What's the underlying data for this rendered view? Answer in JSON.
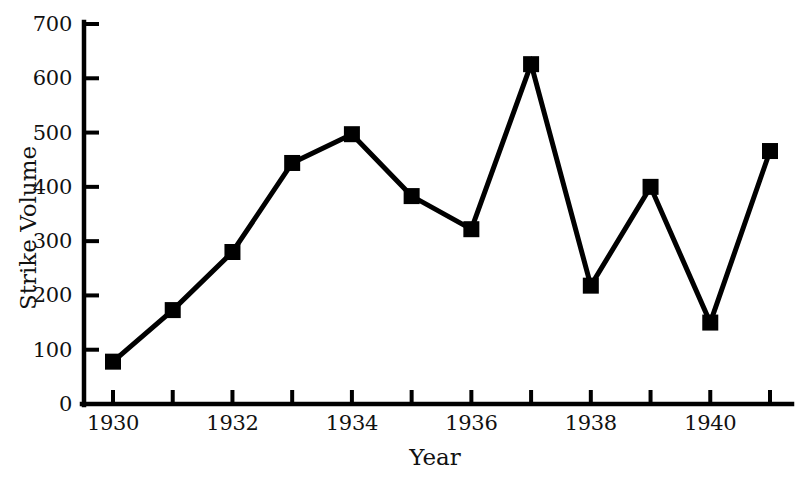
{
  "chart_data": {
    "type": "line",
    "title": "",
    "subtitle": "",
    "xlabel": "Year",
    "ylabel": "Strike Volume",
    "x": [
      1930,
      1931,
      1932,
      1933,
      1934,
      1935,
      1936,
      1937,
      1938,
      1939,
      1940,
      1941
    ],
    "values": [
      78,
      173,
      280,
      444,
      497,
      383,
      322,
      626,
      218,
      400,
      150,
      466
    ],
    "series": [
      {
        "name": "Strike Volume",
        "values": [
          78,
          173,
          280,
          444,
          497,
          383,
          322,
          626,
          218,
          400,
          150,
          466
        ]
      }
    ],
    "xlim": [
      1929.6,
      1941.6
    ],
    "ylim": [
      0,
      700
    ],
    "y_ticks": [
      0,
      100,
      200,
      300,
      400,
      500,
      600,
      700
    ],
    "y_tick_labels": [
      "0",
      "100",
      "200",
      "300",
      "400",
      "500",
      "600",
      "700"
    ],
    "x_ticks": [
      1930,
      1931,
      1932,
      1933,
      1934,
      1935,
      1936,
      1937,
      1938,
      1939,
      1940,
      1941
    ],
    "x_tick_labels": [
      "1930",
      "",
      "1932",
      "",
      "1934",
      "",
      "1936",
      "",
      "1938",
      "",
      "1940",
      ""
    ],
    "x_labeled_ticks": [
      1930,
      1932,
      1934,
      1936,
      1938,
      1940
    ],
    "grid": false,
    "legend": false,
    "legend_position": "none",
    "marker": "square",
    "marker_size": 16,
    "line_width": 5,
    "line_color": "#000000",
    "marker_color": "#000000",
    "axis_color": "#000000",
    "background_color": "#ffffff",
    "annotations": []
  },
  "axes": {
    "y_title": "Strike Volume",
    "x_title": "Year"
  }
}
